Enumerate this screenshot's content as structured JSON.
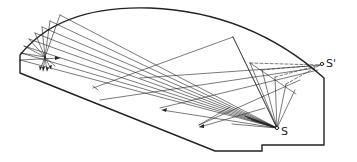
{
  "diagram": {
    "type": "ray-reflection-section",
    "stroke_color": "#222222",
    "labels": {
      "source": "S",
      "image_source": "S'"
    },
    "points": {
      "source": [
        277,
        128
      ],
      "image_source": [
        322,
        64
      ]
    }
  }
}
